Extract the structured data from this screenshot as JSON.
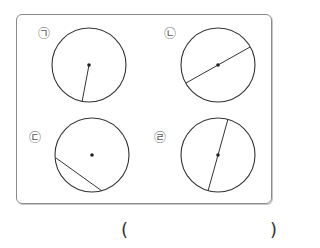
{
  "figures": [
    {
      "label": "㉠",
      "kind": "radius"
    },
    {
      "label": "㉡",
      "kind": "diameter"
    },
    {
      "label": "㉢",
      "kind": "chord"
    },
    {
      "label": "㉣",
      "kind": "diameter"
    }
  ],
  "answer": {
    "open_paren": "(",
    "close_paren": ")",
    "value": ""
  },
  "colors": {
    "stroke": "#333333",
    "frame": "#8a8a8a"
  }
}
